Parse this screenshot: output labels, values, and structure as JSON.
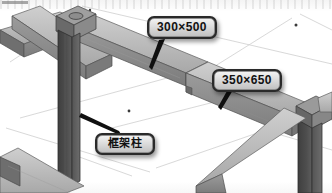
{
  "figure": {
    "type": "3d-structural-frame-isometric",
    "background_color": "#fdfdfd"
  },
  "callouts": [
    {
      "id": "dim-1",
      "label": "300×500",
      "kind": "beam-dimension",
      "points_to": "upper-beam",
      "box_color": "#2a2a2a",
      "text_color": "#121212"
    },
    {
      "id": "dim-2",
      "label": "350×650",
      "kind": "beam-dimension",
      "points_to": "deep-beam",
      "box_color": "#2a2a2a",
      "text_color": "#121212"
    },
    {
      "id": "column",
      "label": "框架柱",
      "kind": "member-name",
      "points_to": "frame-column",
      "box_color": "#2a2a2a",
      "text_color": "#121212"
    }
  ],
  "members": {
    "beam_top_face_color": "#b9b9b9",
    "beam_side_face_color": "#8e8e8e",
    "beam_edge_color": "#5a5a5a",
    "column_face_color": "#4a4a4a",
    "column_side_color": "#636363",
    "joint_color": "#6f6f6f",
    "grid_line_color": "#c9c9c9",
    "node_dot_color": "#3a3a3a",
    "leader_color": "#111111"
  }
}
